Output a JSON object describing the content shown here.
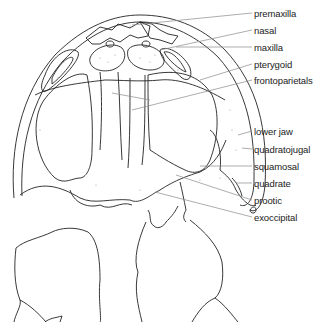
{
  "diagram": {
    "labels": [
      {
        "text": "premaxilla",
        "y": 8
      },
      {
        "text": "nasal",
        "y": 25
      },
      {
        "text": "maxilla",
        "y": 42
      },
      {
        "text": "pterygoid",
        "y": 59
      },
      {
        "text": "frontoparietals",
        "y": 75
      },
      {
        "text": "lower jaw",
        "y": 126
      },
      {
        "text": "quadratojugal",
        "y": 144
      },
      {
        "text": "squamosal",
        "y": 161
      },
      {
        "text": "quadrate",
        "y": 178
      },
      {
        "text": "prootic",
        "y": 195
      },
      {
        "text": "exoccipital",
        "y": 212
      }
    ],
    "colors": {
      "outline": "#222222",
      "leader": "#8a8a8a",
      "stipple": "#9a9a9a",
      "background": "#ffffff"
    }
  }
}
